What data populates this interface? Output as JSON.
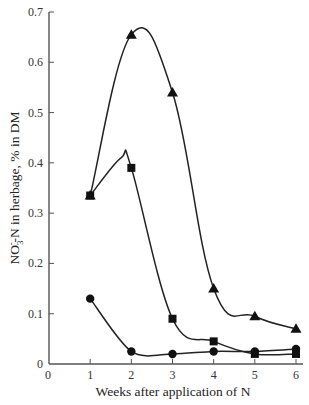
{
  "chart_data": {
    "type": "line",
    "title": "",
    "xlabel": "Weeks after application of N",
    "ylabel_parts": {
      "pre": "NO",
      "sub": "3",
      "sup": "-",
      "post": "-N in herbage, % in DM"
    },
    "ylabel": "NO3-N in herbage, % in DM",
    "xlim": [
      0,
      6
    ],
    "ylim": [
      0,
      0.7
    ],
    "x_ticks": [
      0,
      1,
      2,
      3,
      4,
      5,
      6
    ],
    "y_ticks": [
      0,
      0.1,
      0.2,
      0.3,
      0.4,
      0.5,
      0.6,
      0.7
    ],
    "y_tick_labels": [
      "0",
      "0.1",
      "0.2",
      "0.3",
      "0.4",
      "0.5",
      "0.6",
      "0.7"
    ],
    "x_tick_labels": [
      "0",
      "1",
      "2",
      "3",
      "4",
      "5",
      "6"
    ],
    "grid": false,
    "legend": "none",
    "x": [
      1,
      2,
      3,
      4,
      5,
      6
    ],
    "series": [
      {
        "name": "triangle",
        "marker": "triangle",
        "values": [
          0.335,
          0.655,
          0.54,
          0.15,
          0.095,
          0.07
        ]
      },
      {
        "name": "square",
        "marker": "square",
        "values": [
          0.335,
          0.39,
          0.09,
          0.045,
          0.02,
          0.02
        ]
      },
      {
        "name": "circle",
        "marker": "circle",
        "values": [
          0.13,
          0.025,
          0.02,
          0.025,
          0.025,
          0.03
        ]
      }
    ],
    "colors": {
      "line": "#222222",
      "marker": "#111111",
      "axis": "#555555"
    }
  }
}
